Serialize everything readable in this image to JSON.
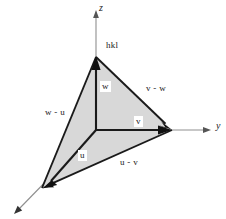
{
  "figure": {
    "background_color": "#ffffff",
    "fill_color": "#d8d8d8",
    "stroke_color": "#1a1a1a",
    "axis_color": "#8a8a8a",
    "axes": [
      {
        "name": "z",
        "label": "z",
        "x": 97,
        "y": 4
      },
      {
        "name": "y",
        "label": "y",
        "x": 214,
        "y": 122
      }
    ],
    "labels": [
      {
        "name": "hkl",
        "text": "hkl",
        "x": 104,
        "y": 41
      },
      {
        "name": "w",
        "text": "w",
        "x": 100,
        "y": 82
      },
      {
        "name": "v-w",
        "text": "v - w",
        "x": 144,
        "y": 84
      },
      {
        "name": "w-u",
        "text": "w - u",
        "x": 43,
        "y": 108
      },
      {
        "name": "v",
        "text": "v",
        "x": 134,
        "y": 117
      },
      {
        "name": "u",
        "text": "u",
        "x": 78,
        "y": 151
      },
      {
        "name": "u-v",
        "text": "u - v",
        "x": 118,
        "y": 158
      }
    ],
    "points": {
      "origin": {
        "x": 96,
        "y": 130
      },
      "hkl_vertex": {
        "x": 96,
        "y": 57
      },
      "v_vertex": {
        "x": 172,
        "y": 130
      },
      "u_vertex": {
        "x": 42,
        "y": 188
      }
    }
  }
}
